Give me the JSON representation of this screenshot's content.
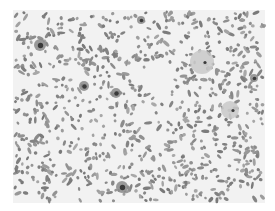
{
  "image": {
    "kind": "grayscale blood smear micrograph",
    "frame": {
      "x": 13,
      "y": 10,
      "width": 252,
      "height": 193
    },
    "colors": {
      "background": "#ffffff",
      "field": "#f2f2f2",
      "cell": "#8c8c8c",
      "dark": "#3a3a3a",
      "pale": "#c9c9c9"
    },
    "features": [
      {
        "type": "nucleated-cell",
        "x": 40,
        "y": 45,
        "r": 6
      },
      {
        "type": "nucleated-cell",
        "x": 84,
        "y": 86,
        "r": 5
      },
      {
        "type": "nucleated-cell",
        "x": 116,
        "y": 93,
        "r": 5
      },
      {
        "type": "nucleated-cell",
        "x": 141,
        "y": 20,
        "r": 4
      },
      {
        "type": "large-pale-cell",
        "x": 202,
        "y": 62,
        "r": 12
      },
      {
        "type": "nucleated-cell",
        "x": 254,
        "y": 78,
        "r": 4
      },
      {
        "type": "nucleated-cell",
        "x": 122,
        "y": 187,
        "r": 6
      },
      {
        "type": "pale-cell",
        "x": 230,
        "y": 110,
        "r": 9
      }
    ]
  }
}
